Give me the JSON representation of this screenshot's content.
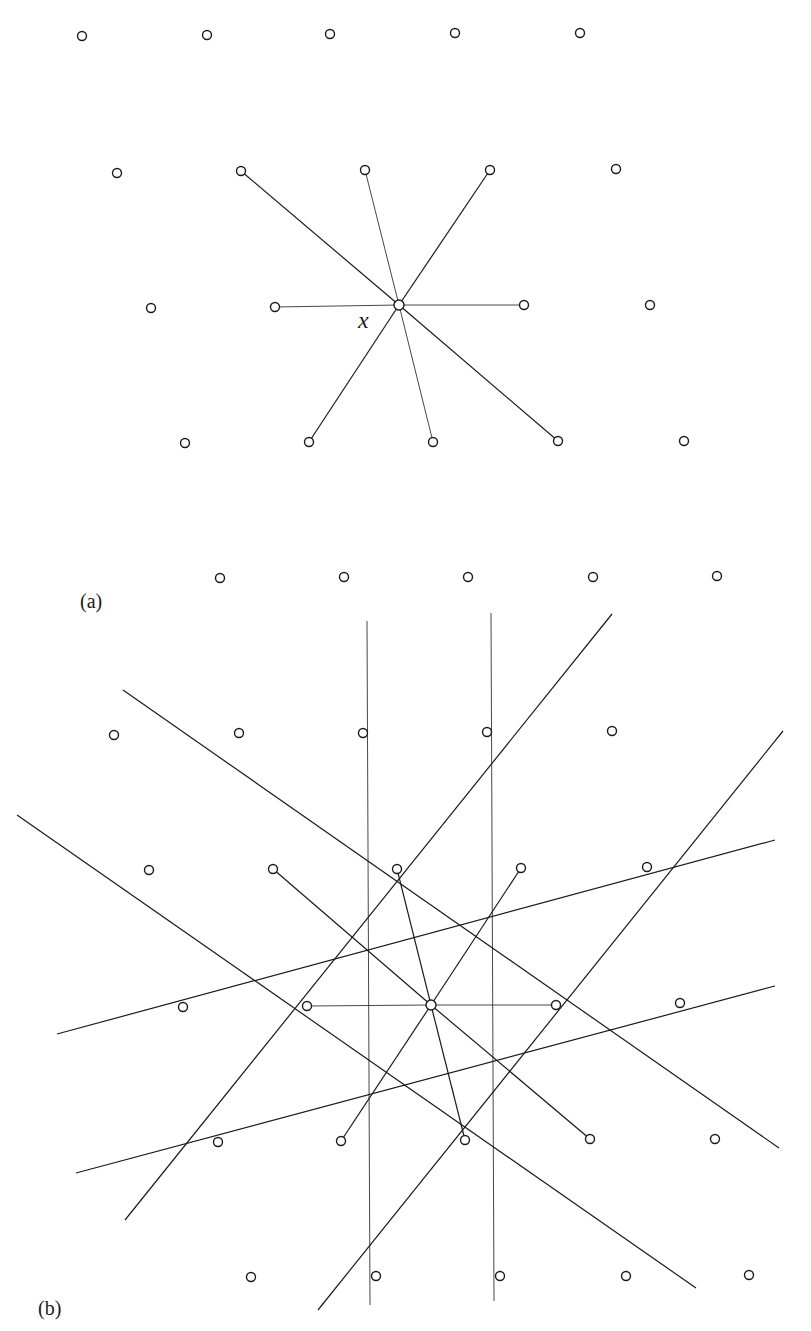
{
  "figure": {
    "panel_a": {
      "label": "(a)",
      "label_pos": [
        80,
        608
      ],
      "center_label": "x",
      "center_label_pos": [
        358,
        328
      ],
      "center": [
        399,
        305
      ],
      "lattice_points": [
        [
          82,
          36
        ],
        [
          207,
          35
        ],
        [
          330,
          34
        ],
        [
          455,
          33
        ],
        [
          580,
          33
        ],
        [
          117,
          173
        ],
        [
          241,
          171
        ],
        [
          365,
          170
        ],
        [
          490,
          170
        ],
        [
          616,
          169
        ],
        [
          151,
          308
        ],
        [
          275,
          307
        ],
        [
          399,
          305
        ],
        [
          524,
          305
        ],
        [
          650,
          305
        ],
        [
          185,
          443
        ],
        [
          309,
          442
        ],
        [
          433,
          442
        ],
        [
          558,
          441
        ],
        [
          684,
          441
        ]
      ],
      "spokes": [
        {
          "to": [
            241,
            171
          ],
          "weight": "thick"
        },
        {
          "to": [
            365,
            170
          ],
          "weight": "thin"
        },
        {
          "to": [
            490,
            170
          ],
          "weight": "thick"
        },
        {
          "to": [
            275,
            307
          ],
          "weight": "thin"
        },
        {
          "to": [
            524,
            305
          ],
          "weight": "thin"
        },
        {
          "to": [
            309,
            442
          ],
          "weight": "thick"
        },
        {
          "to": [
            433,
            442
          ],
          "weight": "thin"
        },
        {
          "to": [
            558,
            441
          ],
          "weight": "thick"
        }
      ]
    },
    "panel_b": {
      "label": "(b)",
      "label_pos": [
        38,
        1315
      ],
      "center": [
        431,
        1005
      ],
      "lattice_points": [
        [
          220,
          578
        ],
        [
          344,
          577
        ],
        [
          468,
          577
        ],
        [
          593,
          577
        ],
        [
          717,
          576
        ],
        [
          114,
          735
        ],
        [
          239,
          733
        ],
        [
          363,
          733
        ],
        [
          487,
          732
        ],
        [
          612,
          731
        ],
        [
          149,
          870
        ],
        [
          273,
          869
        ],
        [
          397,
          869
        ],
        [
          521,
          868
        ],
        [
          647,
          867
        ],
        [
          183,
          1007
        ],
        [
          307,
          1006
        ],
        [
          431,
          1005
        ],
        [
          556,
          1005
        ],
        [
          680,
          1003
        ],
        [
          218,
          1142
        ],
        [
          341,
          1141
        ],
        [
          465,
          1140
        ],
        [
          590,
          1139
        ],
        [
          715,
          1139
        ],
        [
          251,
          1277
        ],
        [
          376,
          1276
        ],
        [
          500,
          1276
        ],
        [
          626,
          1276
        ],
        [
          749,
          1275
        ]
      ],
      "spokes": [
        {
          "to": [
            273,
            869
          ],
          "weight": "thick"
        },
        {
          "to": [
            397,
            869
          ],
          "weight": "thick"
        },
        {
          "to": [
            521,
            868
          ],
          "weight": "thick"
        },
        {
          "to": [
            307,
            1006
          ],
          "weight": "thin"
        },
        {
          "to": [
            556,
            1005
          ],
          "weight": "thin"
        },
        {
          "to": [
            341,
            1141
          ],
          "weight": "thick"
        },
        {
          "to": [
            465,
            1140
          ],
          "weight": "thick"
        },
        {
          "to": [
            590,
            1139
          ],
          "weight": "thick"
        }
      ],
      "long_lines": [
        {
          "kind": "vertical",
          "from": [
            367,
            621
          ],
          "to": [
            370,
            1305
          ]
        },
        {
          "kind": "vertical",
          "from": [
            491,
            613
          ],
          "to": [
            494,
            1301
          ]
        },
        {
          "kind": "diag-up",
          "from": [
            125,
            1220
          ],
          "to": [
            612,
            614
          ]
        },
        {
          "kind": "diag-up",
          "from": [
            318,
            1310
          ],
          "to": [
            783,
            731
          ]
        },
        {
          "kind": "diag-down",
          "from": [
            123,
            690
          ],
          "to": [
            779,
            1148
          ]
        },
        {
          "kind": "diag-down",
          "from": [
            17,
            815
          ],
          "to": [
            696,
            1288
          ]
        },
        {
          "kind": "shallow",
          "from": [
            57,
            1034
          ],
          "to": [
            775,
            840
          ]
        },
        {
          "kind": "shallow",
          "from": [
            76,
            1173
          ],
          "to": [
            775,
            986
          ]
        }
      ]
    },
    "point_radius": 4.5,
    "center_radius": 5
  }
}
